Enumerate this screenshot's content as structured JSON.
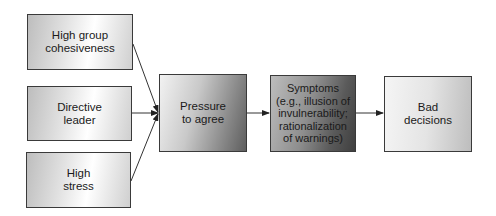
{
  "diagram": {
    "antecedents": [
      {
        "id": "cohesiveness",
        "label": "High group\ncohesiveness"
      },
      {
        "id": "leader",
        "label": "Directive\nleader"
      },
      {
        "id": "stress",
        "label": "High\nstress"
      }
    ],
    "pressure": {
      "label": "Pressure\nto agree"
    },
    "symptoms": {
      "label": "Symptoms\n(e.g., illusion of\ninvulnerability;\nrationalization\nof warnings)"
    },
    "outcome": {
      "label": "Bad\ndecisions"
    },
    "edges": [
      {
        "from": "High group cohesiveness",
        "to": "Pressure to agree"
      },
      {
        "from": "Directive leader",
        "to": "Pressure to agree"
      },
      {
        "from": "High stress",
        "to": "Pressure to agree"
      },
      {
        "from": "Pressure to agree",
        "to": "Symptoms"
      },
      {
        "from": "Symptoms",
        "to": "Bad decisions"
      }
    ]
  }
}
